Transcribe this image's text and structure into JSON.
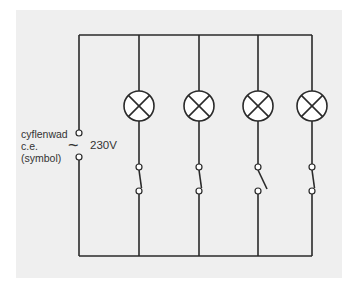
{
  "diagram": {
    "type": "parallel lamp circuit",
    "supply": {
      "label_lines": [
        "cyflenwad",
        "c.e.",
        "(symbol)"
      ],
      "ac_symbol": "~",
      "voltage": "230V"
    },
    "branches": [
      {
        "lamp": "lamp-symbol",
        "switch_state": "closed"
      },
      {
        "lamp": "lamp-symbol",
        "switch_state": "closed"
      },
      {
        "lamp": "lamp-symbol",
        "switch_state": "open"
      },
      {
        "lamp": "lamp-symbol",
        "switch_state": "closed"
      }
    ],
    "colors": {
      "wire": "#2a2a2a",
      "background": "#efefef",
      "text": "#333333"
    }
  }
}
